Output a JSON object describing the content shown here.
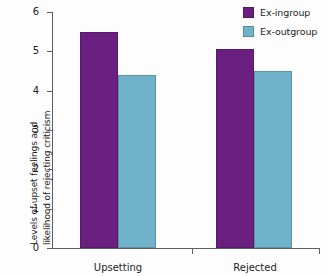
{
  "chart_data": {
    "type": "bar",
    "title": "",
    "subtitle": "",
    "xlabel": "",
    "ylabel": "Levels of upset feelings and likelihood of rejecting criticism",
    "categories": [
      "Upsetting",
      "Rejected"
    ],
    "series": [
      {
        "name": "Ex-ingroup",
        "color": "#6B1F80",
        "values": [
          5.5,
          5.05
        ]
      },
      {
        "name": "Ex-outgroup",
        "color": "#6FB2C9",
        "values": [
          4.4,
          4.5
        ]
      }
    ],
    "ylim": [
      0,
      6
    ],
    "yticks": [
      0,
      1,
      2,
      3,
      4,
      5,
      6
    ],
    "yticklabels": [
      "0",
      "1",
      "2",
      "3",
      "4",
      "5",
      "6"
    ],
    "grid": false,
    "legend_position": "top-right"
  },
  "legend": {
    "items": [
      {
        "label": "Ex-ingroup",
        "swatch_color": "#6B1F80"
      },
      {
        "label": "Ex-outgroup",
        "swatch_color": "#6FB2C9"
      }
    ]
  },
  "axes": {
    "y_title_line1": "Levels of upset feelings and",
    "y_title_line2": "likelihood of rejecting criticism",
    "y_title": "Levels of upset feelings and likelihood of rejecting criticism",
    "y_tick_labels": [
      "6",
      "5",
      "4",
      "3",
      "2",
      "1",
      "0"
    ],
    "x_tick_labels": [
      "Upsetting",
      "Rejected"
    ]
  },
  "colors": {
    "ingroup": "#6B1F80",
    "outgroup": "#6FB2C9",
    "axis": "#5d5d5d",
    "text": "#1d1d1d",
    "background": "#fdfdfd"
  }
}
